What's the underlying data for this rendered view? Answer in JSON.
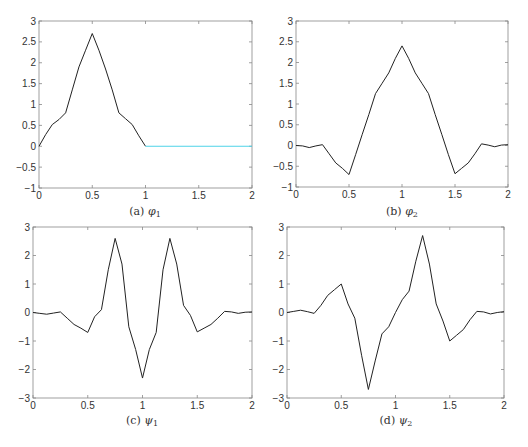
{
  "chart_data": [
    {
      "id": "a",
      "type": "line",
      "caption": "(a) φ1",
      "caption_prefix": "(a)",
      "caption_symbol": "φ",
      "caption_sub": "1",
      "xlim": [
        0,
        2
      ],
      "ylim": [
        -1,
        3
      ],
      "xticks": [
        0,
        0.5,
        1,
        1.5,
        2
      ],
      "xtick_labels": [
        "0",
        "0.5",
        "1",
        "1.5",
        "2"
      ],
      "yticks": [
        -1,
        -0.5,
        0,
        0.5,
        1,
        1.5,
        2,
        2.5,
        3
      ],
      "ytick_labels": [
        "−1",
        "−0.5",
        "0",
        "0.5",
        "1",
        "1.5",
        "2",
        "2.5",
        "3"
      ],
      "grid": false,
      "series": [
        {
          "name": "φ1",
          "color": "#222222",
          "x": [
            0,
            0.0625,
            0.125,
            0.1875,
            0.25,
            0.3125,
            0.375,
            0.4375,
            0.5,
            0.5625,
            0.625,
            0.6875,
            0.75,
            0.8125,
            0.875,
            0.9375,
            1.0
          ],
          "y": [
            0.0,
            0.28,
            0.52,
            0.64,
            0.8,
            1.35,
            1.9,
            2.3,
            2.7,
            2.3,
            1.85,
            1.35,
            0.8,
            0.66,
            0.52,
            0.25,
            0.0
          ]
        },
        {
          "name": "φ1 (zero tail)",
          "color": "#4fd3e8",
          "x": [
            1.0,
            2.0
          ],
          "y": [
            0.0,
            0.0
          ]
        }
      ],
      "box": {
        "left": 39,
        "top": 21,
        "right": 252,
        "bottom": 188
      }
    },
    {
      "id": "b",
      "type": "line",
      "caption": "(b) φ2",
      "caption_prefix": "(b)",
      "caption_symbol": "φ",
      "caption_sub": "2",
      "xlim": [
        0,
        2
      ],
      "ylim": [
        -1,
        3
      ],
      "xticks": [
        0,
        0.5,
        1,
        1.5,
        2
      ],
      "xtick_labels": [
        "0",
        "0.5",
        "1",
        "1.5",
        "2"
      ],
      "yticks": [
        -1,
        -0.5,
        0,
        0.5,
        1,
        1.5,
        2,
        2.5,
        3
      ],
      "ytick_labels": [
        "−1",
        "−0.5",
        "0",
        "0.5",
        "1",
        "1.5",
        "2",
        "2.5",
        "3"
      ],
      "grid": false,
      "series": [
        {
          "name": "φ2",
          "color": "#222222",
          "x": [
            0,
            0.0625,
            0.125,
            0.1875,
            0.25,
            0.3125,
            0.375,
            0.4375,
            0.5,
            0.5625,
            0.625,
            0.6875,
            0.75,
            0.8125,
            0.875,
            0.9375,
            1.0,
            1.0625,
            1.125,
            1.1875,
            1.25,
            1.3125,
            1.375,
            1.4375,
            1.5,
            1.5625,
            1.625,
            1.6875,
            1.75,
            1.8125,
            1.875,
            1.9375,
            2.0
          ],
          "y": [
            0.0,
            -0.01,
            -0.05,
            -0.01,
            0.02,
            -0.2,
            -0.42,
            -0.55,
            -0.7,
            -0.22,
            0.27,
            0.75,
            1.25,
            1.5,
            1.75,
            2.1,
            2.4,
            2.1,
            1.75,
            1.5,
            1.25,
            0.75,
            0.27,
            -0.22,
            -0.68,
            -0.55,
            -0.42,
            -0.2,
            0.04,
            0.01,
            -0.03,
            0.01,
            0.02
          ]
        }
      ],
      "box": {
        "left": 296,
        "top": 21,
        "right": 508,
        "bottom": 187
      }
    },
    {
      "id": "c",
      "type": "line",
      "caption": "(c) ψ1",
      "caption_prefix": "(c)",
      "caption_symbol": "ψ",
      "caption_sub": "1",
      "xlim": [
        0,
        2
      ],
      "ylim": [
        -3,
        3
      ],
      "xticks": [
        0,
        0.5,
        1,
        1.5,
        2
      ],
      "xtick_labels": [
        "0",
        "0.5",
        "1",
        "1.5",
        "2"
      ],
      "yticks": [
        -3,
        -2,
        -1,
        0,
        1,
        2,
        3
      ],
      "ytick_labels": [
        "−3",
        "−2",
        "−1",
        "0",
        "1",
        "2",
        "3"
      ],
      "grid": false,
      "series": [
        {
          "name": "ψ1",
          "color": "#222222",
          "x": [
            0,
            0.0625,
            0.125,
            0.1875,
            0.25,
            0.3125,
            0.375,
            0.4375,
            0.5,
            0.5625,
            0.625,
            0.6875,
            0.75,
            0.8125,
            0.875,
            0.9375,
            1.0,
            1.0625,
            1.125,
            1.1875,
            1.25,
            1.3125,
            1.375,
            1.4375,
            1.5,
            1.5625,
            1.625,
            1.6875,
            1.75,
            1.8125,
            1.875,
            1.9375,
            2.0
          ],
          "y": [
            0.0,
            -0.03,
            -0.06,
            -0.02,
            0.02,
            -0.2,
            -0.42,
            -0.55,
            -0.7,
            -0.15,
            0.1,
            1.5,
            2.6,
            1.7,
            -0.5,
            -1.3,
            -2.3,
            -1.3,
            -0.7,
            1.5,
            2.6,
            1.7,
            0.25,
            -0.1,
            -0.68,
            -0.55,
            -0.42,
            -0.2,
            0.04,
            0.02,
            -0.03,
            0.01,
            0.02
          ]
        }
      ],
      "box": {
        "left": 33,
        "top": 227,
        "right": 252,
        "bottom": 398
      }
    },
    {
      "id": "d",
      "type": "line",
      "caption": "(d) ψ2",
      "caption_prefix": "(d)",
      "caption_symbol": "ψ",
      "caption_sub": "2",
      "xlim": [
        0,
        2
      ],
      "ylim": [
        -3,
        3
      ],
      "xticks": [
        0,
        0.5,
        1,
        1.5,
        2
      ],
      "xtick_labels": [
        "0",
        "0.5",
        "1",
        "1.5",
        "2"
      ],
      "yticks": [
        -3,
        -2,
        -1,
        0,
        1,
        2,
        3
      ],
      "ytick_labels": [
        "−3",
        "−2",
        "−1",
        "0",
        "1",
        "2",
        "3"
      ],
      "grid": false,
      "series": [
        {
          "name": "ψ2",
          "color": "#222222",
          "x": [
            0,
            0.0625,
            0.125,
            0.1875,
            0.25,
            0.3125,
            0.375,
            0.4375,
            0.5,
            0.5625,
            0.625,
            0.6875,
            0.75,
            0.8125,
            0.875,
            0.9375,
            1.0,
            1.0625,
            1.125,
            1.1875,
            1.25,
            1.3125,
            1.375,
            1.4375,
            1.5,
            1.5625,
            1.625,
            1.6875,
            1.75,
            1.8125,
            1.875,
            1.9375,
            2.0
          ],
          "y": [
            0.0,
            0.04,
            0.08,
            0.03,
            -0.03,
            0.25,
            0.6,
            0.8,
            1.0,
            0.3,
            -0.2,
            -1.5,
            -2.7,
            -1.7,
            -0.75,
            -0.5,
            0.0,
            0.45,
            0.75,
            1.8,
            2.7,
            1.7,
            0.3,
            -0.3,
            -1.0,
            -0.8,
            -0.6,
            -0.25,
            0.04,
            0.02,
            -0.05,
            0.0,
            0.03
          ]
        }
      ],
      "box": {
        "left": 287,
        "top": 227,
        "right": 504,
        "bottom": 398
      }
    }
  ],
  "colors": {
    "axis": "#888888",
    "tick_label": "#333333",
    "curve": "#222222",
    "tail": "#4fd3e8"
  }
}
